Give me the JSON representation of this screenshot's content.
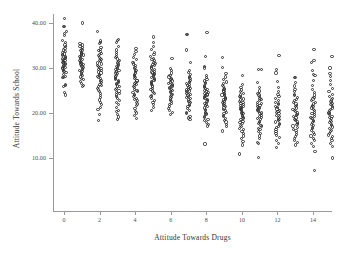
{
  "chart_data": {
    "type": "scatter",
    "title": "",
    "xlabel": "Attitude Towards Drugs",
    "ylabel": "Attitude Towards School",
    "xlim": [
      -0.8,
      15.8
    ],
    "ylim": [
      5.0,
      42.5
    ],
    "grid": false,
    "legend": null,
    "xticks": [
      0,
      2,
      4,
      6,
      8,
      10,
      12,
      14
    ],
    "xticklabels": [
      "0",
      "2",
      "4",
      "6",
      "8",
      "10",
      "12",
      "14"
    ],
    "yticks": [
      10,
      20,
      30,
      40
    ],
    "yticklabels": [
      "10.00",
      "20.00",
      "30.00",
      "40.00"
    ],
    "marker": "open-circle",
    "marker_color": "#2f2f2f",
    "axis_color": "#9a9a9a",
    "background": "#ffffff",
    "columns": [
      {
        "x": 0,
        "min": 24.0,
        "max": 41.0,
        "median": 32.0,
        "n": 46,
        "y": [
          41.0,
          39.3,
          39.2,
          38.2,
          37.6,
          37.3,
          36.2,
          35.6,
          35.1,
          34.7,
          34.3,
          34.0,
          33.7,
          33.4,
          33.1,
          33.0,
          32.8,
          32.6,
          32.4,
          32.2,
          32.0,
          31.8,
          31.7,
          31.5,
          31.3,
          31.1,
          31.0,
          30.8,
          30.6,
          30.4,
          30.2,
          30.0,
          29.8,
          29.6,
          29.4,
          29.2,
          29.0,
          28.6,
          28.1,
          27.9,
          27.8,
          26.4,
          26.2,
          25.9,
          24.6,
          24.0
        ]
      },
      {
        "x": 1,
        "min": 25.9,
        "max": 40.0,
        "median": 31.4,
        "n": 40,
        "y": [
          40.0,
          35.4,
          35.1,
          34.8,
          34.5,
          34.2,
          34.0,
          33.8,
          33.5,
          33.3,
          33.1,
          32.9,
          32.7,
          32.5,
          32.3,
          32.1,
          31.9,
          31.7,
          31.5,
          31.3,
          31.1,
          30.9,
          30.7,
          30.5,
          30.3,
          30.1,
          29.9,
          29.7,
          29.4,
          29.2,
          28.9,
          28.6,
          28.3,
          28.0,
          27.7,
          27.4,
          27.0,
          26.6,
          26.2,
          25.9
        ]
      },
      {
        "x": 2,
        "min": 18.4,
        "max": 38.1,
        "median": 29.5,
        "n": 50,
        "y": [
          38.1,
          36.0,
          35.7,
          35.4,
          34.6,
          34.2,
          33.9,
          33.6,
          33.3,
          33.0,
          32.7,
          32.4,
          32.1,
          31.9,
          31.6,
          31.4,
          31.1,
          30.9,
          30.6,
          30.4,
          30.1,
          29.9,
          29.6,
          29.4,
          29.1,
          28.9,
          28.6,
          28.4,
          28.1,
          27.9,
          27.6,
          27.3,
          27.0,
          26.7,
          26.4,
          26.1,
          25.8,
          25.4,
          25.1,
          24.7,
          24.3,
          23.9,
          23.4,
          22.9,
          22.4,
          21.9,
          21.3,
          20.7,
          19.6,
          18.4
        ]
      },
      {
        "x": 3,
        "min": 18.6,
        "max": 36.4,
        "median": 28.4,
        "n": 52,
        "y": [
          36.4,
          36.2,
          35.6,
          34.8,
          34.0,
          33.4,
          33.0,
          32.6,
          32.3,
          32.0,
          31.7,
          31.4,
          31.1,
          30.9,
          30.6,
          30.4,
          30.1,
          29.9,
          29.6,
          29.4,
          29.1,
          28.9,
          28.7,
          28.4,
          28.2,
          28.0,
          27.7,
          27.5,
          27.3,
          27.0,
          26.8,
          26.5,
          26.3,
          26.0,
          25.8,
          25.5,
          25.2,
          24.9,
          24.6,
          24.3,
          24.0,
          23.6,
          23.2,
          22.8,
          22.3,
          21.9,
          21.3,
          20.6,
          20.3,
          19.7,
          19.1,
          18.6
        ]
      },
      {
        "x": 4,
        "min": 18.7,
        "max": 34.3,
        "median": 27.4,
        "n": 44,
        "y": [
          34.3,
          33.6,
          33.0,
          32.4,
          31.8,
          31.3,
          30.9,
          30.5,
          30.1,
          29.8,
          29.5,
          29.2,
          28.9,
          28.6,
          28.3,
          28.1,
          27.8,
          27.6,
          27.3,
          27.1,
          26.8,
          26.6,
          26.3,
          26.1,
          25.8,
          25.6,
          25.3,
          25.0,
          24.8,
          24.5,
          24.2,
          23.9,
          23.6,
          23.3,
          23.0,
          22.7,
          22.3,
          22.0,
          21.6,
          21.0,
          20.4,
          20.0,
          19.4,
          18.7
        ]
      },
      {
        "x": 5,
        "min": 20.5,
        "max": 36.9,
        "median": 28.9,
        "n": 48,
        "y": [
          36.9,
          35.6,
          34.8,
          34.1,
          33.5,
          33.0,
          32.6,
          32.2,
          31.9,
          31.6,
          31.3,
          31.0,
          30.8,
          30.5,
          30.3,
          30.0,
          29.8,
          29.6,
          29.3,
          29.1,
          28.9,
          28.7,
          28.5,
          28.3,
          28.1,
          27.9,
          27.7,
          27.5,
          27.2,
          27.0,
          26.8,
          26.5,
          26.3,
          26.0,
          25.8,
          25.5,
          25.2,
          24.9,
          24.6,
          24.3,
          23.9,
          23.6,
          23.2,
          22.8,
          22.3,
          21.8,
          21.2,
          20.5
        ]
      },
      {
        "x": 6,
        "min": 19.7,
        "max": 32.1,
        "median": 26.3,
        "n": 34,
        "y": [
          32.1,
          29.9,
          29.4,
          28.9,
          28.4,
          28.0,
          27.7,
          27.4,
          27.1,
          26.9,
          26.6,
          26.4,
          26.1,
          25.9,
          25.7,
          25.4,
          25.2,
          25.0,
          24.7,
          24.5,
          24.2,
          24.0,
          23.7,
          23.4,
          23.1,
          22.8,
          22.5,
          22.1,
          21.8,
          21.4,
          21.0,
          20.6,
          20.1,
          19.7
        ]
      },
      {
        "x": 7,
        "min": 18.6,
        "max": 37.5,
        "median": 25.6,
        "n": 42,
        "y": [
          37.5,
          37.4,
          34.0,
          31.3,
          29.5,
          29.0,
          28.6,
          28.2,
          27.9,
          27.6,
          27.3,
          27.0,
          26.8,
          26.5,
          26.3,
          26.1,
          25.9,
          25.7,
          25.5,
          25.3,
          25.1,
          24.9,
          24.7,
          24.4,
          24.2,
          24.0,
          23.7,
          23.5,
          23.2,
          22.9,
          22.6,
          22.3,
          22.0,
          21.7,
          21.4,
          21.0,
          20.6,
          20.2,
          19.8,
          19.3,
          18.9,
          18.6
        ]
      },
      {
        "x": 8,
        "min": 13.1,
        "max": 37.8,
        "median": 24.8,
        "n": 46,
        "y": [
          37.8,
          32.6,
          30.3,
          30.0,
          28.4,
          27.9,
          27.5,
          27.1,
          26.8,
          26.5,
          26.2,
          25.9,
          25.7,
          25.4,
          25.2,
          25.0,
          24.8,
          24.6,
          24.4,
          24.2,
          24.0,
          23.8,
          23.6,
          23.4,
          23.2,
          23.0,
          22.7,
          22.5,
          22.2,
          22.0,
          21.7,
          21.4,
          21.1,
          20.8,
          20.5,
          20.2,
          19.9,
          19.6,
          19.3,
          19.0,
          18.6,
          18.3,
          17.9,
          17.5,
          17.1,
          13.1
        ]
      },
      {
        "x": 9,
        "min": 16.0,
        "max": 32.4,
        "median": 23.6,
        "n": 40,
        "y": [
          32.4,
          30.2,
          28.7,
          28.0,
          27.4,
          26.9,
          26.5,
          26.1,
          25.8,
          25.5,
          25.2,
          24.9,
          24.7,
          24.4,
          24.2,
          24.0,
          23.8,
          23.5,
          23.3,
          23.1,
          22.9,
          22.6,
          22.4,
          22.2,
          21.9,
          21.7,
          21.4,
          21.1,
          20.8,
          20.5,
          20.2,
          19.9,
          19.5,
          19.2,
          18.8,
          18.4,
          18.0,
          17.5,
          17.0,
          16.0
        ]
      },
      {
        "x": 10,
        "min": 10.9,
        "max": 28.3,
        "median": 21.4,
        "n": 44,
        "y": [
          28.3,
          26.4,
          25.6,
          25.1,
          24.7,
          24.3,
          24.0,
          23.7,
          23.4,
          23.1,
          22.9,
          22.6,
          22.4,
          22.2,
          21.9,
          21.7,
          21.5,
          21.3,
          21.1,
          20.9,
          20.7,
          20.5,
          20.2,
          20.0,
          19.8,
          19.5,
          19.3,
          19.0,
          18.8,
          18.5,
          18.2,
          17.9,
          17.6,
          17.3,
          17.0,
          16.6,
          16.3,
          15.9,
          15.4,
          14.9,
          14.3,
          13.6,
          12.9,
          10.9
        ]
      },
      {
        "x": 11,
        "min": 10.2,
        "max": 29.7,
        "median": 21.0,
        "n": 42,
        "y": [
          29.7,
          29.6,
          26.8,
          25.6,
          24.9,
          24.4,
          24.0,
          23.6,
          23.3,
          23.0,
          22.7,
          22.4,
          22.2,
          21.9,
          21.7,
          21.4,
          21.2,
          21.0,
          20.7,
          20.5,
          20.3,
          20.0,
          19.8,
          19.5,
          19.3,
          19.0,
          18.8,
          18.5,
          18.2,
          17.9,
          17.6,
          17.3,
          17.0,
          16.6,
          16.3,
          15.9,
          15.5,
          14.9,
          14.3,
          13.5,
          13.3,
          10.2
        ]
      },
      {
        "x": 12,
        "min": 12.4,
        "max": 32.8,
        "median": 20.7,
        "n": 38,
        "y": [
          32.8,
          29.6,
          28.9,
          27.0,
          25.6,
          24.7,
          24.1,
          23.6,
          23.2,
          22.8,
          22.4,
          22.1,
          21.8,
          21.5,
          21.2,
          20.9,
          20.6,
          20.4,
          20.1,
          19.8,
          19.5,
          19.2,
          18.9,
          18.6,
          18.3,
          18.0,
          17.7,
          17.4,
          17.0,
          16.7,
          16.3,
          15.9,
          15.4,
          15.0,
          14.5,
          13.9,
          13.3,
          12.4
        ]
      },
      {
        "x": 13,
        "min": 12.9,
        "max": 27.9,
        "median": 20.0,
        "n": 40,
        "y": [
          27.9,
          27.8,
          26.8,
          26.0,
          25.3,
          24.7,
          24.2,
          23.8,
          23.4,
          23.0,
          22.7,
          22.3,
          22.0,
          21.7,
          21.4,
          21.1,
          20.8,
          20.5,
          20.3,
          20.0,
          19.7,
          19.5,
          19.2,
          18.9,
          18.6,
          18.3,
          18.0,
          17.7,
          17.4,
          17.1,
          16.8,
          16.4,
          16.1,
          15.7,
          15.3,
          14.8,
          14.4,
          13.9,
          13.4,
          12.9
        ]
      },
      {
        "x": 14,
        "min": 7.2,
        "max": 34.2,
        "median": 19.6,
        "n": 44,
        "y": [
          34.2,
          31.6,
          31.3,
          29.4,
          28.6,
          28.4,
          27.3,
          26.1,
          25.2,
          24.5,
          24.0,
          23.5,
          23.1,
          22.7,
          22.4,
          22.0,
          21.7,
          21.4,
          21.1,
          20.8,
          20.5,
          20.2,
          19.9,
          19.6,
          19.3,
          19.0,
          18.7,
          18.4,
          18.1,
          17.8,
          17.5,
          17.2,
          16.8,
          16.5,
          16.1,
          15.7,
          15.3,
          14.9,
          14.4,
          13.9,
          13.3,
          12.6,
          11.4,
          7.2
        ]
      },
      {
        "x": 15,
        "min": 10.0,
        "max": 32.6,
        "median": 19.2,
        "n": 42,
        "y": [
          32.6,
          30.0,
          28.7,
          28.2,
          27.3,
          26.3,
          25.5,
          24.8,
          24.2,
          23.7,
          23.3,
          22.9,
          22.5,
          22.1,
          21.8,
          21.4,
          21.1,
          20.8,
          20.5,
          20.2,
          19.9,
          19.6,
          19.3,
          19.0,
          18.7,
          18.4,
          18.1,
          17.8,
          17.5,
          17.2,
          16.9,
          16.6,
          16.2,
          15.9,
          15.5,
          15.1,
          14.7,
          14.3,
          13.8,
          13.2,
          12.5,
          10.0
        ]
      }
    ]
  }
}
